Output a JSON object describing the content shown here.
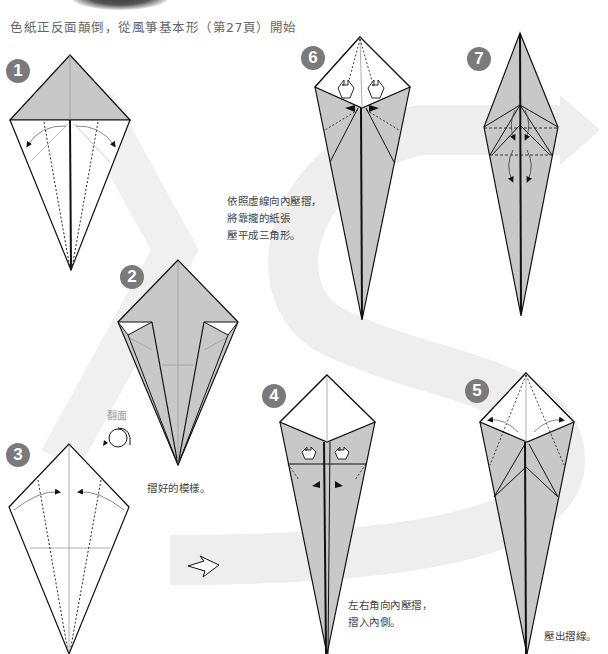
{
  "header": {
    "instruction": "色紙正反面顛倒，從風箏基本形（第27頁）開始"
  },
  "steps": [
    {
      "number": "1",
      "note": ""
    },
    {
      "number": "2",
      "note": "摺好的模樣。"
    },
    {
      "number": "3",
      "note": ""
    },
    {
      "number": "4",
      "note_lines": [
        "左右角向內壓摺，",
        "摺入內側。"
      ]
    },
    {
      "number": "5",
      "note": "壓出摺線。"
    },
    {
      "number": "6",
      "note_lines": [
        "依照虛線向內壓摺，",
        "將靠攏的紙張",
        "壓平成三角形。"
      ]
    },
    {
      "number": "7",
      "note": ""
    }
  ],
  "flip": {
    "label": "翻面",
    "icon": "flip-over-icon"
  },
  "icons": {
    "next_arrow": "outline-right-arrow-icon",
    "flow_band": "s-curve-flow-band"
  },
  "colors": {
    "paper_gray": "#c8c8c8",
    "paper_white": "#ffffff",
    "line": "#111111",
    "crease": "#999999",
    "band": "#eeeeee",
    "badge": "#7a7a7a",
    "text": "#555555"
  }
}
